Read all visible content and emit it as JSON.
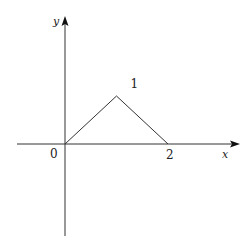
{
  "chart_data": {
    "type": "line",
    "title": "",
    "xlabel": "x",
    "ylabel": "y",
    "series": [
      {
        "name": "triangle",
        "x": [
          0,
          1,
          2
        ],
        "y": [
          0,
          1,
          0
        ]
      }
    ],
    "annotations": [
      {
        "text": "0",
        "at": [
          0,
          0
        ],
        "role": "origin-label"
      },
      {
        "text": "1",
        "at": [
          1,
          1
        ],
        "role": "peak-label"
      },
      {
        "text": "2",
        "at": [
          2,
          0
        ],
        "role": "x-tick-label"
      }
    ],
    "xlim": [
      -0.9,
      2.3
    ],
    "ylim": [
      -1.9,
      2.5
    ],
    "grid": false,
    "legend": "none"
  },
  "colors": {
    "axis": "#333333",
    "line": "#333333"
  }
}
